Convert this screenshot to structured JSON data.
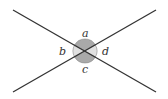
{
  "diagram": {
    "intersection": {
      "x": 85,
      "y": 51
    },
    "lines": [
      {
        "name": "line-1",
        "x1": 13,
        "y1": 10,
        "x2": 156,
        "y2": 92
      },
      {
        "name": "line-2",
        "x1": 13,
        "y1": 92,
        "x2": 156,
        "y2": 10
      }
    ],
    "angles": [
      {
        "label": "a",
        "position": "top",
        "shade": "#a9a9a9"
      },
      {
        "label": "b",
        "position": "left",
        "shade": "#e0e0e0"
      },
      {
        "label": "c",
        "position": "bottom",
        "shade": "#a9a9a9"
      },
      {
        "label": "d",
        "position": "right",
        "shade": "#e0e0e0"
      }
    ],
    "colors": {
      "line": "#333333",
      "dark_sector": "#a9a9a9",
      "light_sector": "#e0e0e0"
    }
  }
}
